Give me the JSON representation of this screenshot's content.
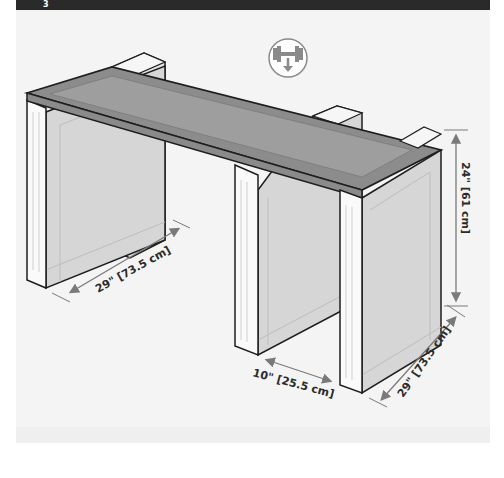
{
  "header": {
    "step_number": "3"
  },
  "icon": {
    "name": "weight-load-down-icon",
    "stroke": "#8a8a8a"
  },
  "dimensions": {
    "height_label": "24\" [61 cm]",
    "left_depth_label": "29\" [73.5 cm]",
    "gap_label": "10\" [25.5 cm]",
    "right_depth_label": "29\" [73.5 cm]"
  },
  "colors": {
    "tabletop": "#8c8c8c",
    "tabletop_inner": "#9e9e9e",
    "panel": "#d6d6d6",
    "leg_front": "#fafafa",
    "outline": "#1e1e1e",
    "dimension_line": "#7a7a7a"
  }
}
